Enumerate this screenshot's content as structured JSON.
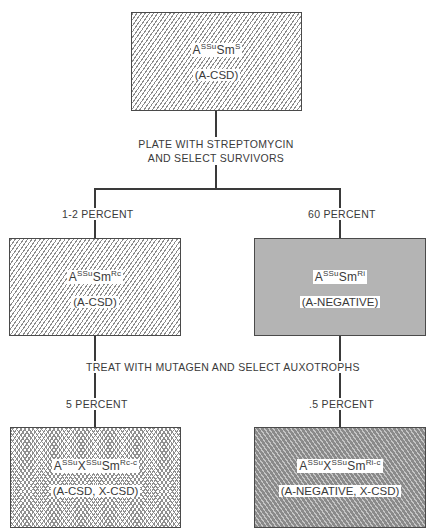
{
  "diagram": {
    "top_box": {
      "genotype": {
        "base1": "A",
        "sup1": "SSu",
        "base2": "Sm",
        "sup2": "S"
      },
      "phenotype": "(A-CSD)",
      "fill": "diagonal-hatch"
    },
    "step1": {
      "line1": "PLATE WITH STREPTOMYCIN",
      "line2": "AND SELECT SURVIVORS"
    },
    "left_branch1_label": "1-2 PERCENT",
    "right_branch1_label": "60 PERCENT",
    "mid_left_box": {
      "genotype": {
        "base1": "A",
        "sup1": "SSu",
        "base2": "Sm",
        "sup2": "Rc"
      },
      "phenotype": "(A-CSD)",
      "fill": "diagonal-hatch"
    },
    "mid_right_box": {
      "genotype": {
        "base1": "A",
        "sup1": "SSu",
        "base2": "Sm",
        "sup2": "Ri"
      },
      "phenotype": "(A-NEGATIVE)",
      "fill": "solid-gray"
    },
    "step2": {
      "line1": "TREAT WITH MUTAGEN AND SELECT AUXOTROPHS"
    },
    "left_branch2_label": "5 PERCENT",
    "right_branch2_label": ".5 PERCENT",
    "bottom_left_box": {
      "genotype": {
        "base1": "A",
        "sup1": "SSu",
        "base2": "X",
        "sup2": "SSu",
        "base3": "Sm",
        "sup3": "Rc-c"
      },
      "phenotype": "(A-CSD, X-CSD)",
      "fill": "crosshatch"
    },
    "bottom_right_box": {
      "genotype": {
        "base1": "A",
        "sup1": "SSu",
        "base2": "X",
        "sup2": "SSu",
        "base3": "Sm",
        "sup3": "Ri-c"
      },
      "phenotype": "(A-NEGATIVE, X-CSD)",
      "fill": "dark-diagonal-hatch"
    }
  },
  "colors": {
    "line": "#3a3a3a",
    "solid_gray": "#b4b4b4",
    "dark_hatch": "#8a8a8a"
  }
}
